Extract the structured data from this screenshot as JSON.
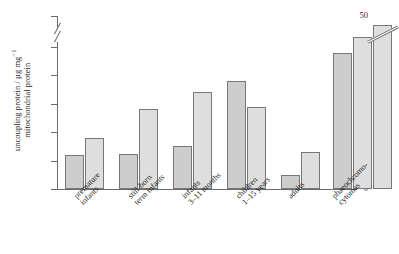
{
  "chart_data": {
    "type": "bar",
    "title": "",
    "xlabel": "",
    "ylabel": "uncoupling protein / µg mg⁻¹ mitochondrial protein",
    "ylabel_line1": "uncoupling protein / µg mg",
    "ylabel_exponent": "−1",
    "ylabel_line2": "mitochondrial protein",
    "ylim": [
      0,
      50
    ],
    "axis_break": {
      "present": true,
      "between": [
        25,
        50
      ],
      "style": "double-slash"
    },
    "grid": false,
    "legend": null,
    "yticks": [
      0,
      5,
      10,
      15,
      20,
      25,
      50
    ],
    "ytick_labels": [
      "0",
      "5",
      "10",
      "15",
      "20",
      "25",
      "50"
    ],
    "categories": [
      "premature infants",
      "still-born term infants",
      "infants 3–11 months",
      "children 1–15 years",
      "adults",
      "phaeochromo- cytomas"
    ],
    "category_lines": [
      [
        "premature",
        "infants"
      ],
      [
        "still-born",
        "term infants"
      ],
      [
        "infants",
        "3–11 months"
      ],
      [
        "children",
        "1–15 years"
      ],
      [
        "adults"
      ],
      [
        "phaeochromo-",
        "cytomas"
      ]
    ],
    "groups": [
      {
        "name": "premature infants",
        "values": [
          6.0,
          9.0
        ]
      },
      {
        "name": "still-born term infants",
        "values": [
          6.2,
          14.0
        ]
      },
      {
        "name": "infants 3–11 months",
        "values": [
          7.5,
          17.0
        ]
      },
      {
        "name": "children 1–15 years",
        "values": [
          19.0,
          14.5
        ]
      },
      {
        "name": "adults",
        "values": [
          2.5,
          6.5
        ]
      },
      {
        "name": "phaeochromo- cytomas",
        "values": [
          24.0,
          26.0,
          52.0
        ],
        "last_bar_off_scale": true
      }
    ],
    "values_flat": [
      6.0,
      9.0,
      6.2,
      14.0,
      7.5,
      17.0,
      19.0,
      14.5,
      2.5,
      6.5,
      24.0,
      26.0,
      52.0
    ],
    "colors": {
      "bar_fill_dark": "#cdcdcd",
      "bar_fill_light": "#dedede",
      "bar_outline": "#77787a",
      "axis": "#6b6b6b",
      "text": "#1a1a1a",
      "background": "#ffffff"
    }
  }
}
